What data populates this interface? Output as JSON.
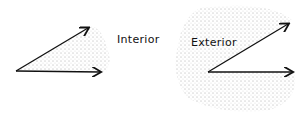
{
  "figures": [
    {
      "id": "interior",
      "label": "Interior",
      "label_pos": [
        117,
        33
      ],
      "vertex": [
        16,
        71
      ],
      "ray1_end": [
        88,
        28
      ],
      "ray2_end": [
        100,
        72
      ]
    },
    {
      "id": "exterior",
      "label": "Exterior",
      "label_pos": [
        191,
        36
      ],
      "vertex": [
        208,
        72
      ],
      "ray1_end": [
        288,
        24
      ],
      "ray2_end": [
        292,
        72
      ]
    }
  ],
  "colors": {
    "ink": "#111111",
    "stipple": "#555555"
  }
}
